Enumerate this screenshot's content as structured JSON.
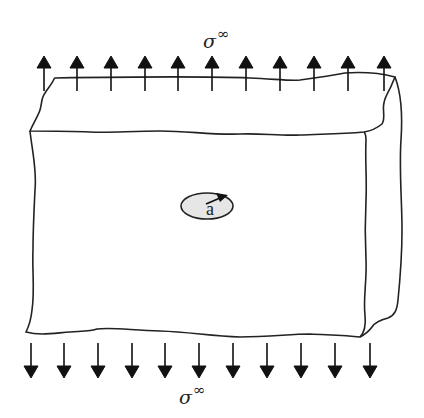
{
  "diagram": {
    "top_label": {
      "symbol": "σ",
      "superscript": "∞"
    },
    "bottom_label": {
      "symbol": "σ",
      "superscript": "∞"
    },
    "crack_label": "a",
    "top_arrow_count": 11,
    "bottom_arrow_count": 11,
    "top_arrows_direction": "up",
    "bottom_arrows_direction": "down",
    "colors": {
      "line": "#222222",
      "crack_fill": "#e6e6e6",
      "background": "#ffffff"
    }
  }
}
